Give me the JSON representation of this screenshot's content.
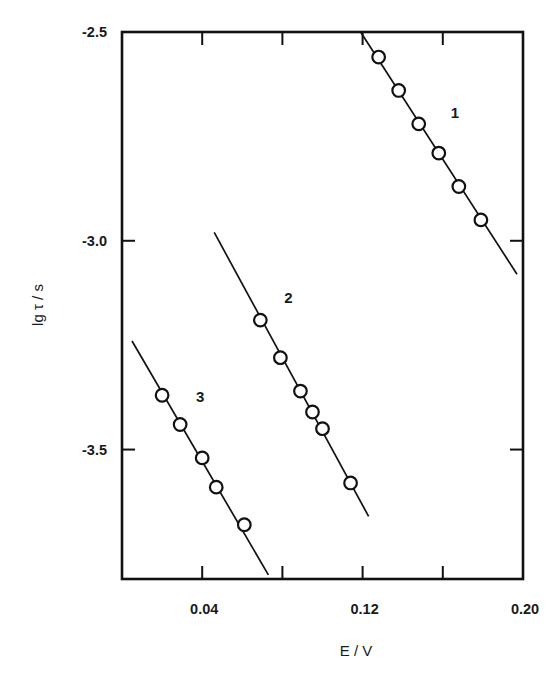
{
  "chart_data": {
    "type": "scatter",
    "title": "",
    "xlabel": "E / V",
    "ylabel": "lg τ / s",
    "xlim": [
      0.0,
      0.2
    ],
    "ylim": [
      -3.81,
      -2.5
    ],
    "grid": false,
    "legend": "none (series numbered inline: 1, 2, 3)",
    "x_ticks": [
      0.04,
      0.08,
      0.12,
      0.16,
      0.2
    ],
    "x_tick_labels": [
      "0.04",
      "",
      "0.12",
      "",
      "0.20"
    ],
    "y_ticks": [
      -2.5,
      -3.0,
      -3.5
    ],
    "y_tick_labels": [
      "-2.5",
      "-3.0",
      "-3.5"
    ],
    "marker": "open circle",
    "series": [
      {
        "name": "1",
        "label_pos": {
          "x": 0.166,
          "y": -2.705
        },
        "x": [
          0.128,
          0.138,
          0.148,
          0.158,
          0.168,
          0.179
        ],
        "y": [
          -2.56,
          -2.64,
          -2.72,
          -2.79,
          -2.87,
          -2.95
        ],
        "fit_line": {
          "x": [
            0.119,
            0.197
          ],
          "y": [
            -2.5,
            -3.08
          ]
        }
      },
      {
        "name": "2",
        "label_pos": {
          "x": 0.083,
          "y": -3.15
        },
        "x": [
          0.069,
          0.079,
          0.089,
          0.095,
          0.1,
          0.114
        ],
        "y": [
          -3.19,
          -3.28,
          -3.36,
          -3.41,
          -3.45,
          -3.58
        ],
        "fit_line": {
          "x": [
            0.046,
            0.123
          ],
          "y": [
            -2.98,
            -3.66
          ]
        }
      },
      {
        "name": "3",
        "label_pos": {
          "x": 0.039,
          "y": -3.385
        },
        "x": [
          0.02,
          0.029,
          0.04,
          0.047,
          0.061
        ],
        "y": [
          -3.37,
          -3.44,
          -3.52,
          -3.59,
          -3.68
        ],
        "fit_line": {
          "x": [
            0.005,
            0.073
          ],
          "y": [
            -3.24,
            -3.8
          ]
        }
      }
    ]
  },
  "style": {
    "ink_color": "#111111",
    "background": "#ffffff"
  }
}
